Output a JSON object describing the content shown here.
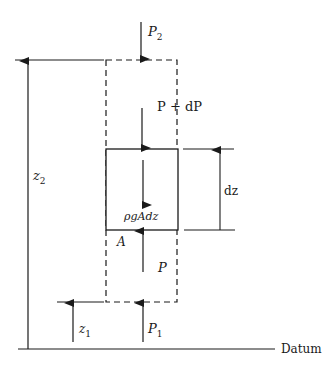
{
  "diagram": {
    "type": "fluid-element-force-balance",
    "labels": {
      "p2": "P",
      "p2_sub": "2",
      "p_plus_dp": "P + dP",
      "weight": "ρgAdz",
      "area": "A",
      "p": "P",
      "p1": "P",
      "p1_sub": "1",
      "z2": "z",
      "z2_sub": "2",
      "z1": "z",
      "z1_sub": "1",
      "dz": "dz",
      "datum": "Datum"
    },
    "colors": {
      "stroke": "#1a1a1a",
      "background": "#ffffff"
    }
  }
}
